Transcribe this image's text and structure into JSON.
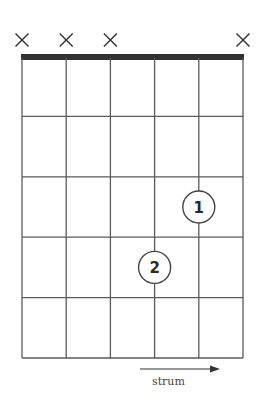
{
  "diagram": {
    "type": "guitar-chord-chart",
    "strings": 6,
    "frets_shown": 5,
    "string_markers": [
      "x",
      "x",
      "x",
      "",
      "",
      "x"
    ],
    "fingers": [
      {
        "finger": "1",
        "string": 5,
        "fret": 3
      },
      {
        "finger": "2",
        "string": 4,
        "fret": 4
      }
    ],
    "strum_label": "strum",
    "colors": {
      "grid": "#5a5a5a",
      "nut": "#333333",
      "marker": "#333333"
    }
  }
}
